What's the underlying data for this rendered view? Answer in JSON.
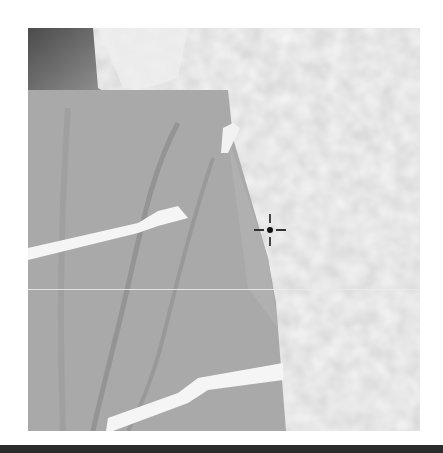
{
  "view": {
    "type": "grayscale-camera-frame",
    "frame": {
      "x": 28,
      "y": 28,
      "width": 392,
      "height": 403
    },
    "content": "pixelated close-up of a dark sleeve with white diagonal stripes against a light mottled background",
    "crosshair": {
      "x": 270,
      "y": 230
    },
    "scanline_y": 289
  },
  "colors": {
    "sleeve": "#a8a8a8",
    "sleeve_dark": "#8e8e8e",
    "background": "#d6d6d6",
    "stripe": "#f4f4f4",
    "corner_dark": "#3a3a3a",
    "bottom_bar": "#2b2b2b"
  }
}
